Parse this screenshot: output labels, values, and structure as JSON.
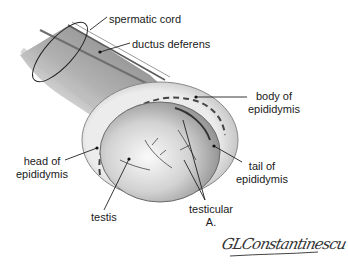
{
  "labels": {
    "spermatic_cord": "spermatic cord",
    "ductus_deferens": "ductus deferens",
    "body_of_epididymis": [
      "body of",
      "epididymis"
    ],
    "head_of_epididymis": [
      "head of",
      "epididymis"
    ],
    "tail_of_epididymis": [
      "tail of",
      "epididymis"
    ],
    "testis": "testis",
    "testicular_artery": [
      "testicular",
      "A."
    ]
  },
  "signature": "GLConstantinescu"
}
